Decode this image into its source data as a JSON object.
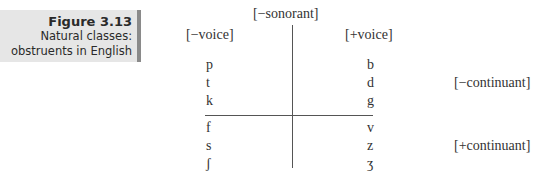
{
  "caption": {
    "figure_number": "Figure 3.13",
    "line1": "Natural classes:",
    "line2": "obstruents in English"
  },
  "diagram": {
    "top_label": "[−sonorant]",
    "left_label": "[−voice]",
    "right_label": "[+voice]",
    "rows": [
      {
        "voiceless": "p",
        "voiced": "b"
      },
      {
        "voiceless": "t",
        "voiced": "d"
      },
      {
        "voiceless": "k",
        "voiced": "g"
      },
      {
        "voiceless": "f",
        "voiced": "v"
      },
      {
        "voiceless": "s",
        "voiced": "z"
      },
      {
        "voiceless": "ʃ",
        "voiced": "ʒ"
      }
    ],
    "upper_group_label": "[−continuant]",
    "lower_group_label": "[+continuant]"
  }
}
